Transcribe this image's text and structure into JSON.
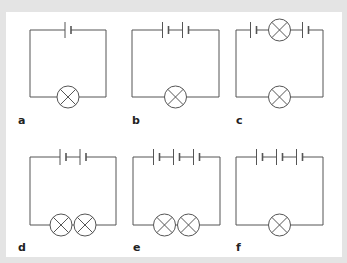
{
  "figure": {
    "circuits": [
      {
        "label": "a",
        "cells": 1,
        "lamps_bottom": 1,
        "lamps_top": 0
      },
      {
        "label": "b",
        "cells": 2,
        "lamps_bottom": 1,
        "lamps_top": 0
      },
      {
        "label": "c",
        "cells": 2,
        "lamps_bottom": 1,
        "lamps_top": 1
      },
      {
        "label": "d",
        "cells": 2,
        "lamps_bottom": 2,
        "lamps_top": 0
      },
      {
        "label": "e",
        "cells": 3,
        "lamps_bottom": 2,
        "lamps_top": 0
      },
      {
        "label": "f",
        "cells": 3,
        "lamps_bottom": 1,
        "lamps_top": 0
      }
    ],
    "colors": {
      "frame": "#e4e4e4",
      "panel": "#ffffff",
      "wire": "#555555",
      "label": "#222222"
    }
  }
}
